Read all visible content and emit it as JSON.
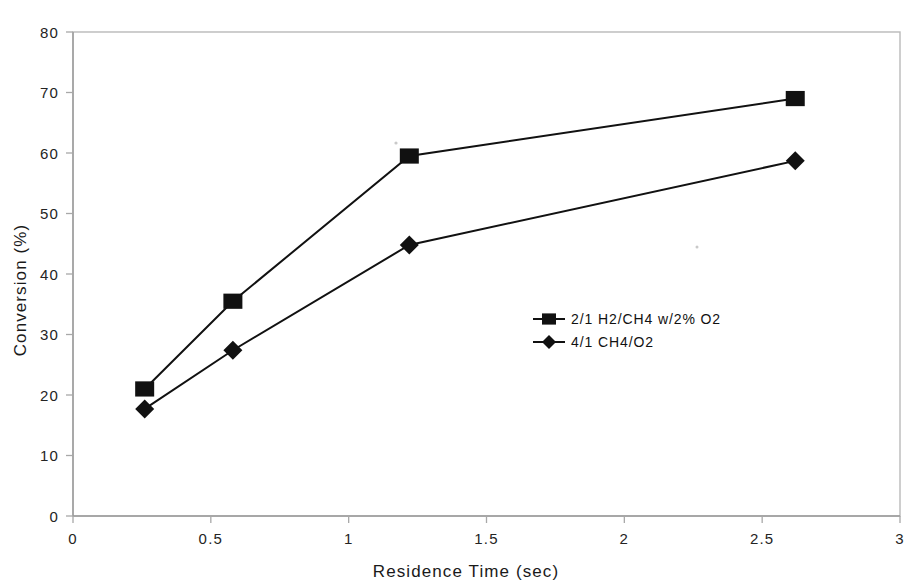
{
  "chart_data": {
    "type": "line",
    "title": "",
    "xlabel": "Residence Time (sec)",
    "ylabel": "Conversion (%)",
    "xlim": [
      0,
      3
    ],
    "ylim": [
      0,
      80
    ],
    "xticks": [
      "0",
      "0.5",
      "1",
      "1.5",
      "2",
      "2.5",
      "3"
    ],
    "xtick_values": [
      0,
      0.5,
      1,
      1.5,
      2,
      2.5,
      3
    ],
    "yticks": [
      "0",
      "10",
      "20",
      "30",
      "40",
      "50",
      "60",
      "70",
      "80"
    ],
    "ytick_values": [
      0,
      10,
      20,
      30,
      40,
      50,
      60,
      70,
      80
    ],
    "grid": false,
    "legend_position": "center-right",
    "series": [
      {
        "name": "2/1 H2/CH4 w/2% O2",
        "marker": "square",
        "color": "#111111",
        "x": [
          0.26,
          0.58,
          1.22,
          2.62
        ],
        "values": [
          21.0,
          35.5,
          59.5,
          69.0
        ]
      },
      {
        "name": "4/1 CH4/O2",
        "marker": "diamond",
        "color": "#111111",
        "x": [
          0.26,
          0.58,
          1.22,
          2.62
        ],
        "values": [
          17.7,
          27.4,
          44.8,
          58.7
        ]
      }
    ]
  }
}
